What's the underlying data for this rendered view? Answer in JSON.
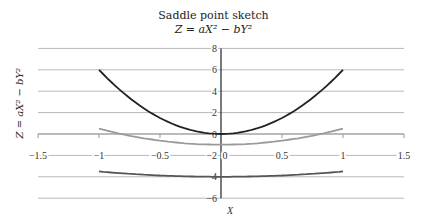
{
  "chart_data": {
    "type": "line",
    "title": "Saddle point sketch",
    "subtitle": "Z = aX² − bY²",
    "xlabel": "X",
    "ylabel": "Z = aX² − bY²",
    "xlim": [
      -1.5,
      1.5
    ],
    "ylim": [
      -6,
      8
    ],
    "x_ticks": [
      "−1.5",
      "−1",
      "−0.5",
      "0",
      "0.5",
      "1",
      "1.5"
    ],
    "y_ticks": [
      "8",
      "6",
      "4",
      "2",
      "0",
      "−2",
      "−4",
      "−6"
    ],
    "grid": true,
    "legend": "none",
    "x": [
      -1,
      -0.75,
      -0.5,
      -0.25,
      0,
      0.25,
      0.5,
      0.75,
      1
    ],
    "series": [
      {
        "name": "upper curve",
        "color": "#222222",
        "values": [
          6,
          3.375,
          1.5,
          0.375,
          0,
          0.375,
          1.5,
          3.375,
          6
        ]
      },
      {
        "name": "middle curve",
        "color": "#9a9a9a",
        "values": [
          0.5,
          -0.156,
          -0.625,
          -0.906,
          -1,
          -0.906,
          -0.625,
          -0.156,
          0.5
        ]
      },
      {
        "name": "lower curve",
        "color": "#555555",
        "values": [
          -3.5,
          -3.719,
          -3.875,
          -3.969,
          -4,
          -3.969,
          -3.875,
          -3.719,
          -3.5
        ]
      }
    ]
  }
}
